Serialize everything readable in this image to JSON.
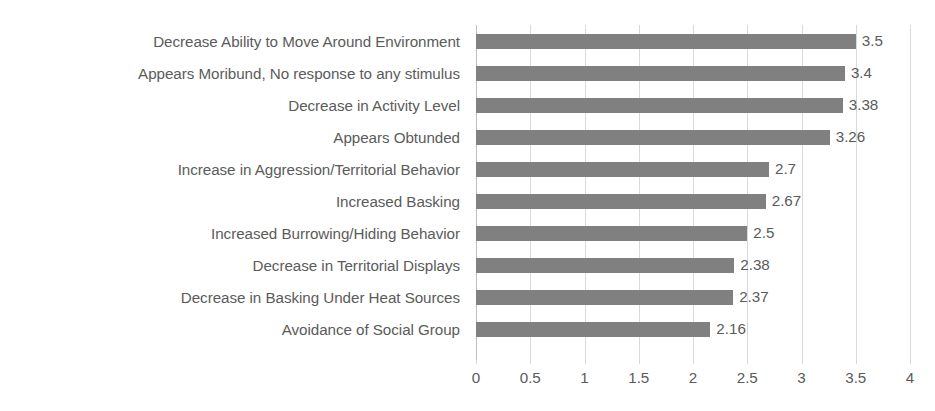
{
  "chart_data": {
    "type": "bar",
    "orientation": "horizontal",
    "title": "",
    "subtitle": "",
    "xlabel": "",
    "ylabel": "",
    "xlim": [
      0,
      4
    ],
    "xticks": [
      "0",
      "0.5",
      "1",
      "1.5",
      "2",
      "2.5",
      "3",
      "3.5",
      "4"
    ],
    "xtick_values": [
      0,
      0.5,
      1,
      1.5,
      2,
      2.5,
      3,
      3.5,
      4
    ],
    "grid": true,
    "legend": false,
    "legend_position": "none",
    "bar_color": "#808080",
    "gridline_color": "#d9d9d9",
    "text_color": "#5b5b5b",
    "background_color": "#ffffff",
    "categories": [
      "Decrease Ability to Move Around Environment",
      "Appears Moribund, No response to any stimulus",
      "Decrease in Activity Level",
      "Appears Obtunded",
      "Increase in Aggression/Territorial Behavior",
      "Increased Basking",
      "Increased Burrowing/Hiding Behavior",
      "Decrease in Territorial Displays",
      "Decrease in Basking Under Heat Sources",
      "Avoidance of Social Group"
    ],
    "values": [
      3.5,
      3.4,
      3.38,
      3.26,
      2.7,
      2.67,
      2.5,
      2.38,
      2.37,
      2.16
    ],
    "value_labels": [
      "3.5",
      "3.4",
      "3.38",
      "3.26",
      "2.7",
      "2.67",
      "2.5",
      "2.38",
      "2.37",
      "2.16"
    ]
  }
}
